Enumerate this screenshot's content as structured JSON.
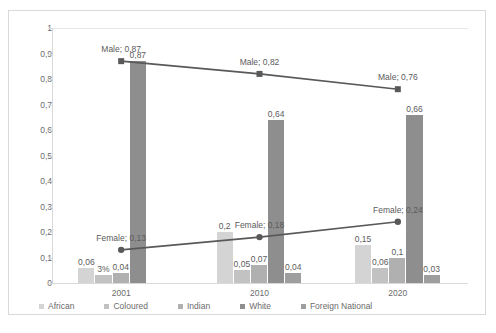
{
  "chart_data": {
    "type": "bar",
    "title": "",
    "subtitle": "",
    "xlabel": "",
    "ylabel": "",
    "categories": [
      "2001",
      "2010",
      "2020"
    ],
    "ylim": [
      0,
      1
    ],
    "ytick_labels": [
      "0",
      "0,1",
      "0,2",
      "0,3",
      "0,4",
      "0,5",
      "0,6",
      "0,7",
      "0,8",
      "0,9",
      "1"
    ],
    "ytick_values": [
      0,
      0.1,
      0.2,
      0.3,
      0.4,
      0.5,
      0.6,
      0.7,
      0.8,
      0.9,
      1
    ],
    "grid": false,
    "legend_position": "bottom",
    "series": [
      {
        "name": "African",
        "kind": "bar",
        "color": "#d4d4d4",
        "values": [
          0.06,
          0.2,
          0.15
        ],
        "labels": [
          "0,06",
          "0,2",
          "0,15"
        ]
      },
      {
        "name": "Coloured",
        "kind": "bar",
        "color": "#c2c2c2",
        "values": [
          0.03,
          0.05,
          0.06
        ],
        "labels": [
          "3%",
          "0,05",
          "0,06"
        ]
      },
      {
        "name": "Indian",
        "kind": "bar",
        "color": "#b0b0b0",
        "values": [
          0.04,
          0.07,
          0.1
        ],
        "labels": [
          "0,04",
          "0,07",
          "0,1"
        ]
      },
      {
        "name": "White",
        "kind": "bar",
        "color": "#8e8e8e",
        "values": [
          0.87,
          0.64,
          0.66
        ],
        "labels": [
          "0,87",
          "0,64",
          "0,66"
        ]
      },
      {
        "name": "Foreign National",
        "kind": "bar",
        "color": "#9e9e9e",
        "values": [
          0.0,
          0.04,
          0.03
        ],
        "labels": [
          "",
          "0,04",
          "0,03"
        ]
      },
      {
        "name": "Male",
        "kind": "line",
        "color": "#595959",
        "marker": "square",
        "values": [
          0.87,
          0.82,
          0.76
        ],
        "labels": [
          "Male; 0,87",
          "Male; 0,82",
          "Male; 0,76"
        ]
      },
      {
        "name": "Female",
        "kind": "line",
        "color": "#595959",
        "marker": "circle",
        "values": [
          0.13,
          0.18,
          0.24
        ],
        "labels": [
          "Female; 0,13",
          "Female; 0,18",
          "Female; 0,24"
        ]
      }
    ],
    "legend_entries": [
      {
        "label": "African",
        "color": "#d4d4d4"
      },
      {
        "label": "Coloured",
        "color": "#c2c2c2"
      },
      {
        "label": "Indian",
        "color": "#b0b0b0"
      },
      {
        "label": "White",
        "color": "#8e8e8e"
      },
      {
        "label": "Foreign National",
        "color": "#9e9e9e"
      }
    ]
  }
}
